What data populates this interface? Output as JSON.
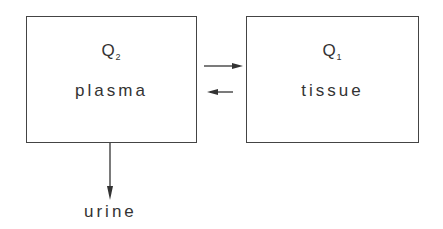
{
  "diagram": {
    "compartments": [
      {
        "id": "plasma",
        "quantity": "Q",
        "subscript": "2",
        "name": "plasma"
      },
      {
        "id": "tissue",
        "quantity": "Q",
        "subscript": "1",
        "name": "tissue"
      }
    ],
    "arrows": [
      {
        "from": "plasma",
        "to": "tissue"
      },
      {
        "from": "tissue",
        "to": "plasma"
      },
      {
        "from": "plasma",
        "to": "urine"
      }
    ],
    "output_label": "urine"
  }
}
